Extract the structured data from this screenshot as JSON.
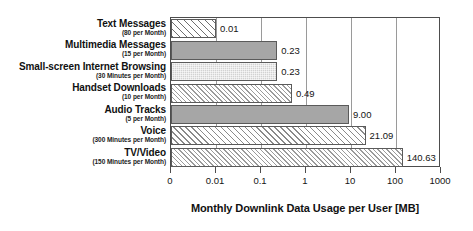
{
  "chart_data": {
    "type": "bar",
    "orientation": "horizontal",
    "title": "",
    "xlabel": "Monthly Downlink Data Usage per User [MB]",
    "ylabel": "",
    "xscale": "log",
    "xlim": [
      0,
      1000
    ],
    "grid": true,
    "legend": "none",
    "xticks": [
      {
        "label": "0",
        "value": 0
      },
      {
        "label": "0.01",
        "value": 0.01
      },
      {
        "label": "0.1",
        "value": 0.1
      },
      {
        "label": "1",
        "value": 1
      },
      {
        "label": "10",
        "value": 10
      },
      {
        "label": "100",
        "value": 100
      },
      {
        "label": "1000",
        "value": 1000
      }
    ],
    "categories": [
      "Text Messages",
      "Multimedia Messages",
      "Small-screen Internet Browsing",
      "Handset Downloads",
      "Audio Tracks",
      "Voice",
      "TV/Video"
    ],
    "category_sublabels": [
      "(80 per Month)",
      "(15 per Month)",
      "(30 Minutes per Month)",
      "(10 per Month)",
      "(5 per Month)",
      "(300 Minutes per Month)",
      "(150 Minutes per Month)"
    ],
    "values": [
      0.01,
      0.23,
      0.23,
      0.49,
      9.0,
      21.09,
      140.63
    ],
    "value_labels": [
      "0.01",
      "0.23",
      "0.23",
      "0.49",
      "9.00",
      "21.09",
      "140.63"
    ],
    "bar_fills": [
      "hatch-wide",
      "solid-dark",
      "stipple-light",
      "hatch-fine",
      "solid-dark",
      "hatch-med",
      "hatch-fine"
    ]
  },
  "colors": {
    "frame": "#4d4d4d",
    "gridline": "#9a9a9a",
    "bar_outline": "#5a5a5a",
    "solid_dark": "#a6a6a6",
    "stipple_light": "#d2d2d2",
    "text": "#141414",
    "background": "#ffffff"
  }
}
